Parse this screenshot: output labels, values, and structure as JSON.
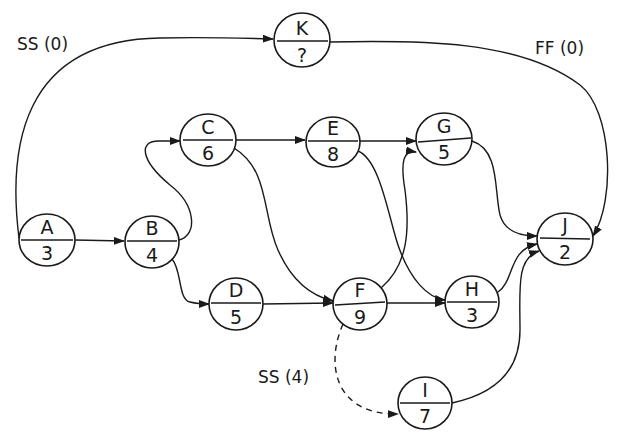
{
  "diagram": {
    "type": "precedence network (activity-on-node)",
    "nodes": [
      {
        "id": "A",
        "duration": "3",
        "cx": 47,
        "cy": 240,
        "rx": 28,
        "ry": 26
      },
      {
        "id": "B",
        "duration": "4",
        "cx": 152,
        "cy": 242,
        "rx": 27,
        "ry": 26
      },
      {
        "id": "C",
        "duration": "6",
        "cx": 208,
        "cy": 140,
        "rx": 28,
        "ry": 26
      },
      {
        "id": "D",
        "duration": "5",
        "cx": 236,
        "cy": 304,
        "rx": 27,
        "ry": 26
      },
      {
        "id": "E",
        "duration": "8",
        "cx": 333,
        "cy": 142,
        "rx": 27,
        "ry": 25
      },
      {
        "id": "F",
        "duration": "9",
        "cx": 360,
        "cy": 304,
        "rx": 27,
        "ry": 26
      },
      {
        "id": "G",
        "duration": "5",
        "cx": 444,
        "cy": 139,
        "rx": 28,
        "ry": 26
      },
      {
        "id": "H",
        "duration": "3",
        "cx": 472,
        "cy": 302,
        "rx": 27,
        "ry": 26
      },
      {
        "id": "I",
        "duration": "7",
        "cx": 425,
        "cy": 403,
        "rx": 27,
        "ry": 26
      },
      {
        "id": "J",
        "duration": "2",
        "cx": 565,
        "cy": 239,
        "rx": 28,
        "ry": 26
      },
      {
        "id": "K",
        "duration": "?",
        "cx": 302,
        "cy": 40,
        "rx": 28,
        "ry": 27
      }
    ],
    "edges": [
      {
        "from": "A",
        "to": "B",
        "style": "solid",
        "label": ""
      },
      {
        "from": "A",
        "to": "K",
        "style": "solid",
        "label": "SS (0)"
      },
      {
        "from": "B",
        "to": "C",
        "style": "solid",
        "label": ""
      },
      {
        "from": "B",
        "to": "D",
        "style": "solid",
        "label": ""
      },
      {
        "from": "C",
        "to": "E",
        "style": "solid",
        "label": ""
      },
      {
        "from": "C",
        "to": "F",
        "style": "solid",
        "label": ""
      },
      {
        "from": "D",
        "to": "F",
        "style": "solid",
        "label": ""
      },
      {
        "from": "E",
        "to": "G",
        "style": "solid",
        "label": ""
      },
      {
        "from": "E",
        "to": "H",
        "style": "solid",
        "label": ""
      },
      {
        "from": "F",
        "to": "G",
        "style": "solid",
        "label": ""
      },
      {
        "from": "F",
        "to": "H",
        "style": "solid",
        "label": ""
      },
      {
        "from": "F",
        "to": "I",
        "style": "dashed",
        "label": "SS (4)"
      },
      {
        "from": "G",
        "to": "J",
        "style": "solid",
        "label": ""
      },
      {
        "from": "H",
        "to": "J",
        "style": "solid",
        "label": ""
      },
      {
        "from": "I",
        "to": "J",
        "style": "solid",
        "label": ""
      },
      {
        "from": "K",
        "to": "J",
        "style": "solid",
        "label": "FF (0)"
      }
    ],
    "annotations": {
      "ss0": "SS (0)",
      "ff0": "FF (0)",
      "ss4": "SS (4)"
    },
    "colors": {
      "ink": "#1a1a1a",
      "background": "#ffffff"
    }
  }
}
